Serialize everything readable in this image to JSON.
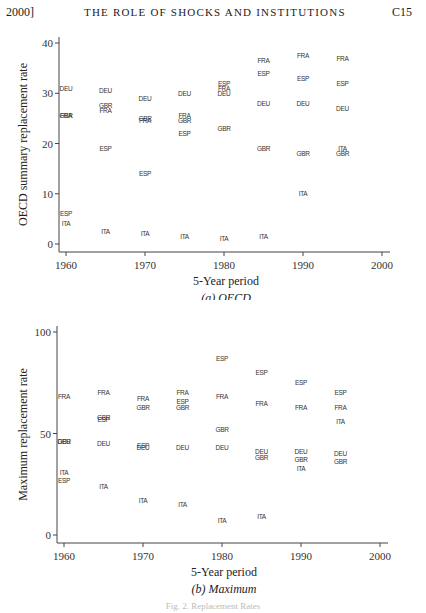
{
  "header": {
    "left": "2000]",
    "title": "THE ROLE OF SHOCKS AND INSTITUTIONS",
    "page": "C15"
  },
  "caption": "Fig. 2. Replacement Rates",
  "chart_data": [
    {
      "type": "scatter",
      "title": "(a) OECD",
      "subtitle": "(a) OECD",
      "xlabel": "5-Year period",
      "ylabel": "OECD summary replacement rate",
      "xlim": [
        1959,
        2001
      ],
      "ylim": [
        -1,
        41
      ],
      "xticks": [
        1960,
        1970,
        1980,
        1990,
        2000
      ],
      "yticks": [
        0,
        10,
        20,
        30,
        40
      ],
      "grid": false,
      "marker": "country code text",
      "series": [
        {
          "name": "DEU",
          "points": [
            [
              1960,
              31
            ],
            [
              1965,
              30.5
            ],
            [
              1970,
              29
            ],
            [
              1975,
              30
            ],
            [
              1980,
              30
            ],
            [
              1985,
              28
            ],
            [
              1990,
              28
            ],
            [
              1995,
              27
            ]
          ]
        },
        {
          "name": "GBR",
          "points": [
            [
              1960,
              25.5
            ],
            [
              1965,
              27.5
            ],
            [
              1970,
              25
            ],
            [
              1975,
              24.5
            ],
            [
              1980,
              23
            ],
            [
              1985,
              19
            ],
            [
              1990,
              18
            ],
            [
              1995,
              18
            ]
          ]
        },
        {
          "name": "FRA",
          "points": [
            [
              1960,
              25.5
            ],
            [
              1965,
              26.5
            ],
            [
              1970,
              24.5
            ],
            [
              1975,
              25.5
            ],
            [
              1980,
              31
            ],
            [
              1985,
              36.5
            ],
            [
              1990,
              37.5
            ],
            [
              1995,
              37
            ]
          ]
        },
        {
          "name": "ESP",
          "points": [
            [
              1960,
              6
            ],
            [
              1965,
              19
            ],
            [
              1970,
              14
            ],
            [
              1975,
              22
            ],
            [
              1980,
              32
            ],
            [
              1985,
              34
            ],
            [
              1990,
              33
            ],
            [
              1995,
              32
            ]
          ]
        },
        {
          "name": "ITA",
          "points": [
            [
              1960,
              4
            ],
            [
              1965,
              2.5
            ],
            [
              1970,
              2
            ],
            [
              1975,
              1.5
            ],
            [
              1980,
              1
            ],
            [
              1985,
              1.5
            ],
            [
              1990,
              10
            ],
            [
              1995,
              19
            ]
          ]
        }
      ]
    },
    {
      "type": "scatter",
      "title": "(b) Maximum",
      "subtitle": "(b) Maximum",
      "xlabel": "5-Year period",
      "ylabel": "Maximum replacement rate",
      "xlim": [
        1959,
        2001
      ],
      "ylim": [
        -3,
        103
      ],
      "xticks": [
        1960,
        1970,
        1980,
        1990,
        2000
      ],
      "yticks": [
        0,
        50,
        100
      ],
      "grid": false,
      "marker": "country code text",
      "series": [
        {
          "name": "FRA",
          "points": [
            [
              1960,
              68
            ],
            [
              1965,
              70
            ],
            [
              1970,
              67
            ],
            [
              1975,
              70
            ],
            [
              1980,
              68
            ],
            [
              1985,
              65
            ],
            [
              1990,
              63
            ],
            [
              1995,
              63
            ]
          ]
        },
        {
          "name": "ESP",
          "points": [
            [
              1960,
              27
            ],
            [
              1965,
              57
            ],
            [
              1970,
              44
            ],
            [
              1975,
              66
            ],
            [
              1980,
              87
            ],
            [
              1985,
              80
            ],
            [
              1990,
              75
            ],
            [
              1995,
              70
            ]
          ]
        },
        {
          "name": "GBR",
          "points": [
            [
              1960,
              46
            ],
            [
              1965,
              58
            ],
            [
              1970,
              63
            ],
            [
              1975,
              63
            ],
            [
              1980,
              52
            ],
            [
              1985,
              38
            ],
            [
              1990,
              37
            ],
            [
              1995,
              36
            ]
          ]
        },
        {
          "name": "DEU",
          "points": [
            [
              1960,
              46
            ],
            [
              1965,
              45
            ],
            [
              1970,
              43
            ],
            [
              1975,
              43
            ],
            [
              1980,
              43
            ],
            [
              1985,
              41
            ],
            [
              1990,
              41
            ],
            [
              1995,
              40
            ]
          ]
        },
        {
          "name": "ITA",
          "points": [
            [
              1960,
              31
            ],
            [
              1965,
              24
            ],
            [
              1970,
              17
            ],
            [
              1975,
              15
            ],
            [
              1980,
              7
            ],
            [
              1985,
              9
            ],
            [
              1990,
              33
            ],
            [
              1995,
              56
            ]
          ]
        }
      ]
    }
  ]
}
